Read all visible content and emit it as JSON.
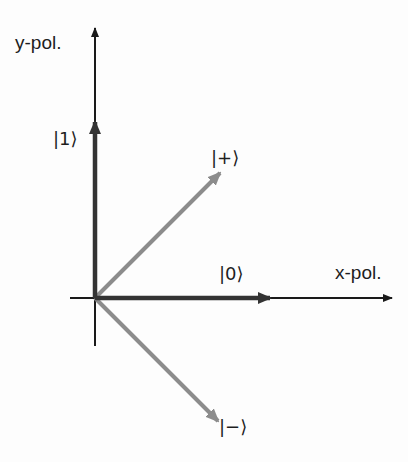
{
  "diagram": {
    "axes": {
      "x_label": "x-pol.",
      "y_label": "y-pol."
    },
    "vectors": [
      {
        "id": "ket0",
        "label": "|0⟩",
        "direction": "x",
        "color": "#333333"
      },
      {
        "id": "ket1",
        "label": "|1⟩",
        "direction": "y",
        "color": "#333333"
      },
      {
        "id": "ketplus",
        "label": "|+⟩",
        "direction": "diagonal-up",
        "color": "#8c8c8c"
      },
      {
        "id": "ketminus",
        "label": "|−⟩",
        "direction": "diagonal-down",
        "color": "#8c8c8c"
      }
    ],
    "colors": {
      "axis": "#1a1a1a",
      "basis_vector": "#333333",
      "diagonal_vector": "#8c8c8c",
      "background": "#fdfdfd"
    }
  }
}
